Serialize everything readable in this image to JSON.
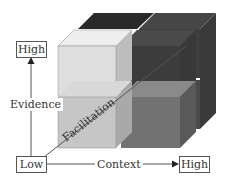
{
  "diagram": {
    "type": "3d-cube-framework",
    "axes": {
      "vertical": {
        "name": "Evidence",
        "low_label": "Low",
        "high_label": "High"
      },
      "horizontal": {
        "name": "Context",
        "low_label": "Low",
        "high_label": "High"
      },
      "depth": {
        "name": "Facilitation"
      }
    },
    "labels": {
      "evidence": "Evidence",
      "context": "Context",
      "facilitation": "Facilitation",
      "high_top": "High",
      "low_origin": "Low",
      "high_right": "High"
    },
    "colors": {
      "front_top_left": "#dcdcdc",
      "front_bottom_left": "#c4c4c4",
      "front_top_right": "#3c3c3c",
      "front_bottom_right": "#6e6e6e",
      "back_top": "#2a2a2a",
      "side_dark": "#4a4a4a",
      "line": "#555555"
    }
  }
}
